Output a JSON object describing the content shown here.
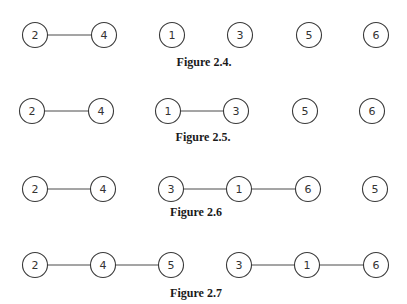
{
  "figures": [
    {
      "caption": "Figure 2.4.",
      "caption_pos": [
        204,
        66
      ],
      "nodes": [
        {
          "label": "2",
          "x": 35,
          "y": 35
        },
        {
          "label": "4",
          "x": 104,
          "y": 35
        },
        {
          "label": "1",
          "x": 172,
          "y": 35
        },
        {
          "label": "3",
          "x": 240,
          "y": 35
        },
        {
          "label": "5",
          "x": 309,
          "y": 35
        },
        {
          "label": "6",
          "x": 376,
          "y": 35
        }
      ],
      "edges": [
        [
          "2",
          "4"
        ]
      ]
    },
    {
      "caption": "Figure 2.5.",
      "caption_pos": [
        203,
        141
      ],
      "nodes": [
        {
          "label": "2",
          "x": 32,
          "y": 111
        },
        {
          "label": "4",
          "x": 101,
          "y": 111
        },
        {
          "label": "1",
          "x": 168,
          "y": 111
        },
        {
          "label": "3",
          "x": 236,
          "y": 111
        },
        {
          "label": "5",
          "x": 305,
          "y": 111
        },
        {
          "label": "6",
          "x": 372,
          "y": 111
        }
      ],
      "edges": [
        [
          "2",
          "4"
        ],
        [
          "1",
          "3"
        ]
      ]
    },
    {
      "caption": "Figure 2.6",
      "caption_pos": [
        196,
        216
      ],
      "nodes": [
        {
          "label": "2",
          "x": 35,
          "y": 189
        },
        {
          "label": "4",
          "x": 103,
          "y": 189
        },
        {
          "label": "3",
          "x": 171,
          "y": 189
        },
        {
          "label": "1",
          "x": 239,
          "y": 189
        },
        {
          "label": "6",
          "x": 308,
          "y": 189
        },
        {
          "label": "5",
          "x": 375,
          "y": 189
        }
      ],
      "edges": [
        [
          "2",
          "4"
        ],
        [
          "3",
          "1"
        ],
        [
          "1",
          "6"
        ]
      ]
    },
    {
      "caption": "Figure 2.7",
      "caption_pos": [
        196,
        297
      ],
      "nodes": [
        {
          "label": "2",
          "x": 35,
          "y": 265
        },
        {
          "label": "4",
          "x": 103,
          "y": 265
        },
        {
          "label": "5",
          "x": 171,
          "y": 265
        },
        {
          "label": "3",
          "x": 239,
          "y": 265
        },
        {
          "label": "1",
          "x": 307,
          "y": 265
        },
        {
          "label": "6",
          "x": 376,
          "y": 265
        }
      ],
      "edges": [
        [
          "2",
          "4"
        ],
        [
          "4",
          "5"
        ],
        [
          "3",
          "1"
        ],
        [
          "1",
          "6"
        ]
      ]
    }
  ],
  "style": {
    "node_radius": 12.5,
    "stroke_color": "#3a3a3a",
    "background": "#ffffff"
  }
}
